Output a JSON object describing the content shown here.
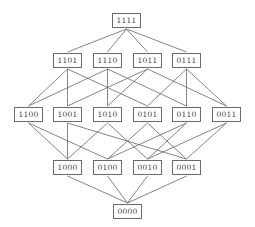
{
  "diagram": {
    "type": "hasse-diagram",
    "colors": {
      "edge": "#666666",
      "border": "#6a6a6a",
      "text": "#444444"
    },
    "nodes": [
      {
        "id": "1111",
        "label": "1111",
        "x": 112,
        "y": 13
      },
      {
        "id": "1101",
        "label": "1101",
        "x": 53,
        "y": 53
      },
      {
        "id": "1110",
        "label": "1110",
        "x": 93,
        "y": 53
      },
      {
        "id": "1011",
        "label": "1011",
        "x": 133,
        "y": 53
      },
      {
        "id": "0111",
        "label": "0111",
        "x": 172,
        "y": 53
      },
      {
        "id": "1100",
        "label": "1100",
        "x": 14,
        "y": 107
      },
      {
        "id": "1001",
        "label": "1001",
        "x": 53,
        "y": 107
      },
      {
        "id": "1010",
        "label": "1010",
        "x": 93,
        "y": 107
      },
      {
        "id": "0101",
        "label": "0101",
        "x": 133,
        "y": 107
      },
      {
        "id": "0110",
        "label": "0110",
        "x": 172,
        "y": 107
      },
      {
        "id": "0011",
        "label": "0011",
        "x": 212,
        "y": 107
      },
      {
        "id": "1000",
        "label": "1000",
        "x": 53,
        "y": 160
      },
      {
        "id": "0100",
        "label": "0100",
        "x": 93,
        "y": 160
      },
      {
        "id": "0010",
        "label": "0010",
        "x": 133,
        "y": 160
      },
      {
        "id": "0001",
        "label": "0001",
        "x": 172,
        "y": 160
      },
      {
        "id": "0000",
        "label": "0000",
        "x": 113,
        "y": 204
      }
    ]
  }
}
